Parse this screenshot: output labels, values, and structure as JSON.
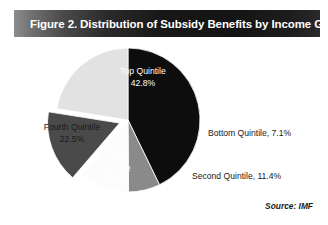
{
  "figure": {
    "title": "Figure 2. Distribution of Subsidy Benefits by Income Group",
    "source": "Source: IMF"
  },
  "labels": {
    "top_quintile_name": "Top Quintile",
    "top_quintile_value": "42.8%",
    "fourth_quintile_name": "Fourth Quintile",
    "fourth_quintile_value": "22.5%",
    "third_quintile_name_line1": "Third",
    "third_quintile_name_line2": "Quintile",
    "third_quintile_value": "16.2%",
    "bottom_quintile_full": "Bottom Quintile, 7.1%",
    "second_quintile_full": "Second Quintile, 11.4%"
  },
  "colors": {
    "top_quintile": "#0d0d0d",
    "bottom_quintile": "#8a8a8a",
    "second_quintile": "#fcfcfc",
    "third_quintile": "#4a4a4a",
    "fourth_quintile": "#e2e2e2",
    "title_text": "#ffffff",
    "body_text": "#1a1a1a",
    "background": "#ffffff"
  },
  "chart_data": {
    "type": "pie",
    "title": "Figure 2. Distribution of Subsidy Benefits by Income Group",
    "xlabel": "",
    "ylabel": "",
    "legend_position": "none",
    "grid": false,
    "units": "percent",
    "total": 100.0,
    "annotations": [
      "Source: IMF"
    ],
    "start_angle_deg": 0,
    "direction": "clockwise",
    "exploded_slices": [
      "Third Quintile"
    ],
    "categories": [
      "Top Quintile",
      "Bottom Quintile",
      "Second Quintile",
      "Third Quintile",
      "Fourth Quintile"
    ],
    "values": [
      42.8,
      7.1,
      11.4,
      16.2,
      22.5
    ],
    "slices": [
      {
        "label": "Top Quintile",
        "value": 42.8,
        "color": "#0d0d0d",
        "text_color": "#ffffff",
        "exploded": false
      },
      {
        "label": "Bottom Quintile",
        "value": 7.1,
        "color": "#8a8a8a",
        "text_color": "#1a1a1a",
        "exploded": false
      },
      {
        "label": "Second Quintile",
        "value": 11.4,
        "color": "#fcfcfc",
        "text_color": "#1a1a1a",
        "exploded": false
      },
      {
        "label": "Third Quintile",
        "value": 16.2,
        "color": "#4a4a4a",
        "text_color": "#ffffff",
        "exploded": true
      },
      {
        "label": "Fourth Quintile",
        "value": 22.5,
        "color": "#e2e2e2",
        "text_color": "#1a1a1a",
        "exploded": false
      }
    ]
  }
}
